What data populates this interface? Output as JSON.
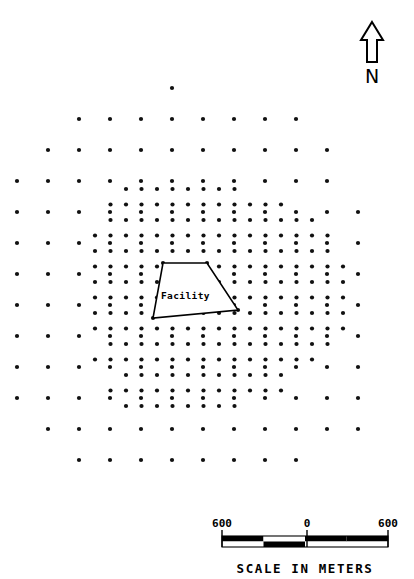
{
  "figure": {
    "type": "site-map",
    "title": "",
    "background_color": "#ffffff",
    "ink_color": "#000000",
    "width": 414,
    "height": 579
  },
  "facility": {
    "label": "Facility",
    "shape": "polygon",
    "fill_color": "#ffffff",
    "outline_color": "#000000",
    "vertices": [
      [
        163,
        263
      ],
      [
        207,
        263
      ],
      [
        238,
        310
      ],
      [
        153,
        318
      ]
    ],
    "label_position": [
      161,
      299
    ]
  },
  "north_arrow": {
    "label": "N",
    "icon": "north-arrow-icon",
    "position": [
      372,
      48
    ],
    "letter_position": [
      372,
      76
    ]
  },
  "scale_bar": {
    "caption": "SCALE IN METERS",
    "caption_position": [
      305,
      573
    ],
    "labels": [
      {
        "text": "600",
        "x": 222
      },
      {
        "text": "0",
        "x": 307
      },
      {
        "text": "600",
        "x": 388
      }
    ],
    "label_y": 527,
    "bar": {
      "x": 222,
      "y": 536,
      "width": 166,
      "height": 11,
      "segments": [
        {
          "top": "#000000",
          "bottom": "#ffffff"
        },
        {
          "top": "#ffffff",
          "bottom": "#000000"
        },
        {
          "top": "#000000",
          "bottom": "#ffffff"
        },
        {
          "top": "#000000",
          "bottom": "#ffffff"
        }
      ],
      "tick_x": [
        222,
        307,
        388
      ],
      "tick_top": 530,
      "tick_bottom": 547
    }
  },
  "grids": {
    "coarse": {
      "name": "regional-sampling-grid",
      "spacing_px": 31,
      "dot_radius": 2.1,
      "origin_x": 17,
      "origin_y": 88,
      "rows": [
        {
          "y": 88,
          "start_col": 5,
          "count": 1
        },
        {
          "y": 119,
          "start_col": 2,
          "count": 8
        },
        {
          "y": 150,
          "start_col": 1,
          "count": 10
        },
        {
          "y": 181,
          "start_col": 0,
          "count": 11
        },
        {
          "y": 212,
          "start_col": 0,
          "count": 12
        },
        {
          "y": 243,
          "start_col": 0,
          "count": 12
        },
        {
          "y": 274,
          "start_col": 0,
          "count": 12
        },
        {
          "y": 305,
          "start_col": 0,
          "count": 12
        },
        {
          "y": 336,
          "start_col": 0,
          "count": 12
        },
        {
          "y": 367,
          "start_col": 0,
          "count": 12
        },
        {
          "y": 398,
          "start_col": 0,
          "count": 12
        },
        {
          "y": 429,
          "start_col": 1,
          "count": 11
        },
        {
          "y": 460,
          "start_col": 2,
          "count": 8
        }
      ]
    },
    "fine": {
      "name": "facility-sampling-grid",
      "spacing_px": 15.5,
      "dot_radius": 2.1,
      "origin_x": 95,
      "origin_y": 189,
      "rows": [
        {
          "y": 189,
          "start_col": 2,
          "count": 8
        },
        {
          "y": 204.5,
          "start_col": 1,
          "count": 12
        },
        {
          "y": 220,
          "start_col": 1,
          "count": 14
        },
        {
          "y": 235.5,
          "start_col": 0,
          "count": 16
        },
        {
          "y": 251,
          "start_col": 0,
          "count": 16
        },
        {
          "y": 266.5,
          "start_col": 0,
          "count": 17
        },
        {
          "y": 282,
          "start_col": 0,
          "count": 17
        },
        {
          "y": 297.5,
          "start_col": 0,
          "count": 17
        },
        {
          "y": 313,
          "start_col": 0,
          "count": 17
        },
        {
          "y": 328.5,
          "start_col": 0,
          "count": 17
        },
        {
          "y": 344,
          "start_col": 1,
          "count": 15
        },
        {
          "y": 359.5,
          "start_col": 0,
          "count": 15
        },
        {
          "y": 375,
          "start_col": 2,
          "count": 11
        },
        {
          "y": 390.5,
          "start_col": 1,
          "count": 12
        },
        {
          "y": 406,
          "start_col": 2,
          "count": 8
        }
      ]
    }
  }
}
